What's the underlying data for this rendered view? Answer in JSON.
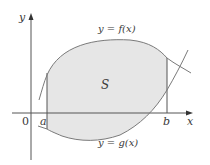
{
  "figure": {
    "region_label": "S",
    "top_curve_label": "y = f(x)",
    "bottom_curve_label": "y = g(x)",
    "y_axis_label": "y",
    "x_axis_label": "x",
    "origin_label": "0",
    "left_bound_label": "a",
    "right_bound_label": "b"
  },
  "colors": {
    "region_fill": "#e6e6e6",
    "curve_stroke": "#7a7a7a",
    "axis_stroke": "#555555",
    "text": "#3a3a3a"
  }
}
